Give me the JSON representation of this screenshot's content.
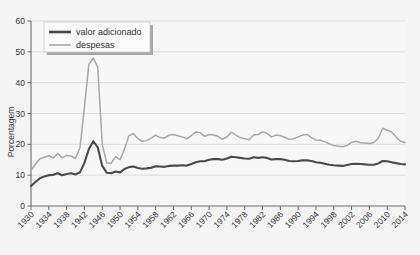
{
  "chart_data": {
    "type": "line",
    "title": "",
    "xlabel": "",
    "ylabel": "Porcentagem",
    "xlim": [
      1930,
      2014
    ],
    "ylim": [
      0,
      60
    ],
    "yticks": [
      0,
      10,
      20,
      30,
      40,
      50,
      60
    ],
    "xticks": [
      1930,
      1934,
      1938,
      1942,
      1946,
      1950,
      1954,
      1958,
      1962,
      1966,
      1970,
      1974,
      1978,
      1982,
      1986,
      1990,
      1994,
      1998,
      2002,
      2006,
      2010,
      2014
    ],
    "grid": true,
    "legend_position": "upper-left",
    "colors": {
      "valor_adicionado": "#4a4a4a",
      "despesas": "#a8a8a8",
      "plot_background": "#f7f7f7",
      "page_background": "#f4f4f4",
      "gridline": "#d8d8d8",
      "axis": "#6b6b6b"
    },
    "x": [
      1930,
      1931,
      1932,
      1933,
      1934,
      1935,
      1936,
      1937,
      1938,
      1939,
      1940,
      1941,
      1942,
      1943,
      1944,
      1945,
      1946,
      1947,
      1948,
      1949,
      1950,
      1951,
      1952,
      1953,
      1954,
      1955,
      1956,
      1957,
      1958,
      1959,
      1960,
      1961,
      1962,
      1963,
      1964,
      1965,
      1966,
      1967,
      1968,
      1969,
      1970,
      1971,
      1972,
      1973,
      1974,
      1975,
      1976,
      1977,
      1978,
      1979,
      1980,
      1981,
      1982,
      1983,
      1984,
      1985,
      1986,
      1987,
      1988,
      1989,
      1990,
      1991,
      1992,
      1993,
      1994,
      1995,
      1996,
      1997,
      1998,
      1999,
      2000,
      2001,
      2002,
      2003,
      2004,
      2005,
      2006,
      2007,
      2008,
      2009,
      2010,
      2011,
      2012,
      2013,
      2014
    ],
    "series": [
      {
        "name": "valor adicionado",
        "color": "#4a4a4a",
        "values": [
          6.5,
          7.8,
          9.0,
          9.6,
          10.0,
          10.1,
          10.6,
          10.0,
          10.4,
          10.6,
          10.2,
          10.9,
          14.0,
          18.5,
          21.0,
          19.0,
          13.0,
          10.8,
          10.6,
          11.2,
          10.9,
          12.0,
          12.6,
          12.8,
          12.3,
          12.1,
          12.2,
          12.4,
          12.9,
          12.8,
          12.7,
          13.0,
          13.1,
          13.1,
          13.2,
          13.1,
          13.6,
          14.2,
          14.5,
          14.5,
          15.0,
          15.2,
          15.2,
          15.0,
          15.4,
          16.0,
          15.8,
          15.6,
          15.4,
          15.3,
          15.8,
          15.6,
          15.8,
          15.6,
          15.1,
          15.2,
          15.2,
          15.0,
          14.6,
          14.5,
          14.6,
          14.8,
          14.8,
          14.6,
          14.2,
          14.0,
          13.7,
          13.4,
          13.2,
          13.1,
          13.0,
          13.3,
          13.6,
          13.7,
          13.6,
          13.5,
          13.4,
          13.4,
          13.8,
          14.6,
          14.5,
          14.2,
          13.9,
          13.6,
          13.5
        ]
      },
      {
        "name": "despesas",
        "color": "#a8a8a8",
        "values": [
          11.5,
          13.6,
          15.3,
          15.8,
          16.3,
          15.6,
          17.0,
          15.6,
          16.4,
          16.2,
          15.4,
          19.0,
          32.0,
          46.0,
          48.0,
          45.0,
          20.0,
          14.0,
          13.8,
          16.0,
          15.0,
          18.5,
          22.8,
          23.5,
          21.8,
          21.0,
          21.2,
          22.0,
          23.0,
          22.2,
          22.0,
          23.0,
          23.2,
          22.8,
          22.4,
          21.8,
          22.8,
          24.0,
          23.8,
          22.6,
          23.2,
          23.0,
          22.6,
          21.6,
          22.4,
          24.0,
          23.0,
          22.2,
          21.8,
          21.5,
          23.0,
          23.2,
          24.0,
          23.6,
          22.4,
          23.0,
          22.8,
          22.3,
          21.6,
          21.8,
          22.4,
          23.0,
          23.2,
          22.2,
          21.4,
          21.3,
          20.8,
          20.2,
          19.6,
          19.4,
          19.2,
          19.6,
          20.6,
          21.0,
          20.5,
          20.4,
          20.3,
          20.6,
          22.0,
          25.2,
          24.6,
          24.0,
          22.4,
          21.0,
          20.6
        ]
      }
    ],
    "legend": [
      {
        "label": "valor adicionado",
        "color": "#4a4a4a",
        "width": 2.6
      },
      {
        "label": "despesas",
        "color": "#a8a8a8",
        "width": 1.6
      }
    ]
  }
}
